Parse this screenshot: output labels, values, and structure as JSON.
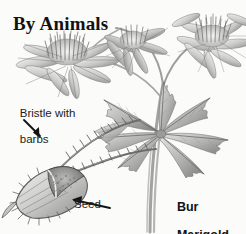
{
  "figure": {
    "title": "By Animals",
    "caption": "Bur Marigold",
    "media": "grayscale pencil botanical illustration",
    "background_color": "#fbfbf9",
    "ink_color": "#1b1b1b"
  },
  "labels": {
    "bristle": "Bristle with\nbarbs",
    "bristle_line1": "Bristle with",
    "bristle_line2": "barbs",
    "seed": "Seed",
    "caption_line1": "Bur",
    "caption_line2": "Marigold"
  },
  "illustration": {
    "subject": "Bur Marigold (Bidens) plant with flowers, palmate compound leaf, and detail of barbed achene seed",
    "elements": [
      {
        "name": "flower-left",
        "description": "daisy-like flower head with tufted disc florets and radiating ray petals, three-quarter view",
        "petal_count": 8
      },
      {
        "name": "flower-top-middle",
        "description": "daisy flower head seen from the side, drooping ray petals",
        "petal_count": 6
      },
      {
        "name": "flower-top-right",
        "description": "daisy flower head with dense disc center and spreading ray petals",
        "petal_count": 9
      },
      {
        "name": "palmate-leaf",
        "description": "large palmately compound leaf with serrated lance-shaped leaflets radiating from a central node",
        "leaflet_count": 7
      },
      {
        "name": "seed-detail",
        "description": "enlarged flattened achene seed bearing two long bristles covered in backward-pointing barbs"
      },
      {
        "name": "stem-group",
        "description": "slender stems rising from lower left to the flower heads"
      }
    ]
  },
  "annotations": [
    {
      "name": "bristle-arrow",
      "points_to": "bristle",
      "direction": "down-right"
    },
    {
      "name": "seed-arrow",
      "points_to": "seed",
      "direction": "up-left"
    }
  ]
}
